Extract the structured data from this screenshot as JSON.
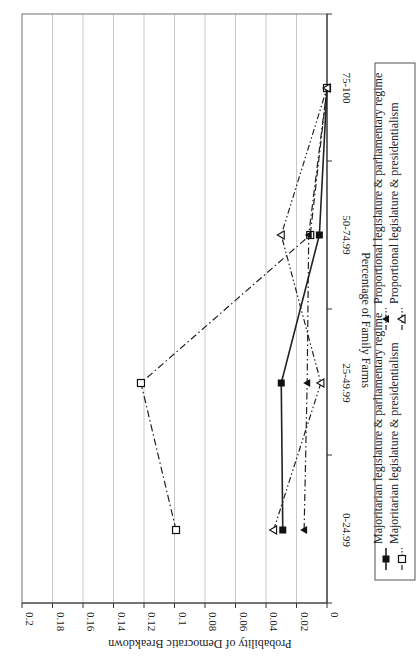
{
  "chart_data": {
    "type": "line",
    "orientation": "rotated-90-clockwise",
    "title": "",
    "xlabel": "Percentage of Family Farms",
    "ylabel": "Probability of Democratic Breakdown",
    "categories": [
      "0-24.99",
      "25-49.99",
      "50-74.99",
      "75-100"
    ],
    "ylim": [
      0,
      0.2
    ],
    "yticks": [
      "0",
      "0.02",
      "0.04",
      "0.06",
      "0.08",
      "0.1",
      "0.12",
      "0.14",
      "0.16",
      "0.18",
      "0.2"
    ],
    "grid": true,
    "legend_position": "bottom",
    "series": [
      {
        "name": "Majoritarian legislature & parliamentary regime",
        "style": "solid",
        "marker": "filled-square",
        "values": [
          0.029,
          0.03,
          0.005,
          0.0
        ]
      },
      {
        "name": "Majoritarian legislature & presidentialism",
        "style": "dash-dot",
        "marker": "open-square",
        "values": [
          0.099,
          0.122,
          0.011,
          0.0
        ]
      },
      {
        "name": "Proportional legislature & parliamentary regime",
        "style": "dash-dot",
        "marker": "filled-triangle",
        "values": [
          0.015,
          0.013,
          0.012,
          0.0
        ]
      },
      {
        "name": "Proportional legislature & presidentialism",
        "style": "dash-dot-dot",
        "marker": "open-triangle",
        "values": [
          0.035,
          0.004,
          0.03,
          0.0
        ]
      }
    ]
  },
  "legend": {
    "items": [
      "Majoritarian legislature & parliamentary regime",
      "Proportional legislature & parliamentary regime",
      "Majoritarian legislature & presidentialism",
      "Proportional legislature & presidentialism"
    ]
  }
}
